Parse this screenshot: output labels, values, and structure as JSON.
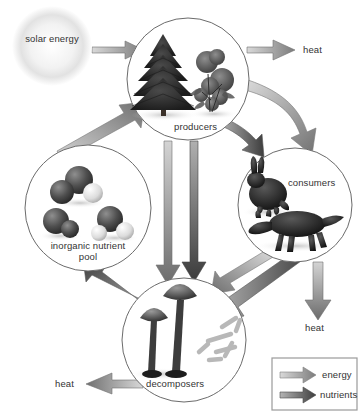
{
  "diagram": {
    "nodes": [
      {
        "id": "solar",
        "label": "solar energy",
        "shape": "glow",
        "cx": 52,
        "cy": 46,
        "r": 38
      },
      {
        "id": "producers",
        "label": "producers",
        "shape": "circle",
        "cx": 188,
        "cy": 79,
        "r": 61,
        "contents": "conifer tree and flowering shrub"
      },
      {
        "id": "consumers",
        "label": "consumers",
        "shape": "circle",
        "cx": 295,
        "cy": 205,
        "r": 57,
        "contents": "rabbit and fox"
      },
      {
        "id": "decomposers",
        "label": "decomposers",
        "shape": "circle",
        "cx": 184,
        "cy": 340,
        "r": 62,
        "contents": "mushrooms and bacteria"
      },
      {
        "id": "pool",
        "label": "inorganic nutrient pool",
        "shape": "circle",
        "cx": 88,
        "cy": 208,
        "r": 63,
        "contents": "molecule models"
      }
    ],
    "heat_labels": [
      {
        "id": "heat-producers",
        "label": "heat",
        "x": 303,
        "y": 44
      },
      {
        "id": "heat-consumers",
        "label": "heat",
        "x": 317,
        "y": 327
      },
      {
        "id": "heat-decomposers",
        "label": "heat",
        "x": 66,
        "y": 384
      }
    ],
    "flows": [
      {
        "id": "solar-to-producers",
        "kind": "energy",
        "from": "solar",
        "to": "producers"
      },
      {
        "id": "producers-to-heat",
        "kind": "energy",
        "from": "producers",
        "to": "heat-producers"
      },
      {
        "id": "producers-to-consumers",
        "kind": "energy",
        "from": "producers",
        "to": "consumers"
      },
      {
        "id": "producers-to-consumers-nutrients",
        "kind": "nutrients",
        "from": "producers",
        "to": "consumers"
      },
      {
        "id": "producers-to-decomposers-energy",
        "kind": "energy",
        "from": "producers",
        "to": "decomposers"
      },
      {
        "id": "producers-to-decomposers-nutrients",
        "kind": "nutrients",
        "from": "producers",
        "to": "decomposers"
      },
      {
        "id": "consumers-to-heat",
        "kind": "energy",
        "from": "consumers",
        "to": "heat-consumers"
      },
      {
        "id": "consumers-to-decomposers-energy",
        "kind": "energy",
        "from": "consumers",
        "to": "decomposers"
      },
      {
        "id": "consumers-to-decomposers-nutrients",
        "kind": "nutrients",
        "from": "consumers",
        "to": "decomposers"
      },
      {
        "id": "decomposers-to-heat",
        "kind": "energy",
        "from": "decomposers",
        "to": "heat-decomposers"
      },
      {
        "id": "decomposers-to-pool",
        "kind": "nutrients",
        "from": "decomposers",
        "to": "pool"
      },
      {
        "id": "pool-to-producers",
        "kind": "nutrients",
        "from": "pool",
        "to": "producers"
      }
    ]
  },
  "legend": {
    "items": [
      {
        "id": "legend-energy",
        "label": "energy",
        "color": "#8d8d8d",
        "kind": "energy"
      },
      {
        "id": "legend-nutrients",
        "label": "nutrients",
        "color": "#4a4a4a",
        "kind": "nutrients"
      }
    ]
  },
  "colors": {
    "energy_arrow": "#8d8d8d",
    "nutrient_arrow": "#4a4a4a",
    "circle_stroke": "#6b6b6b",
    "text": "#333333",
    "background": "#ffffff"
  }
}
